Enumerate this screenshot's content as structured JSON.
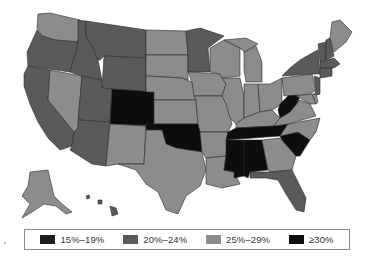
{
  "map": {
    "title": "",
    "region": "United States",
    "colors": {
      "c15_19": "#1c1c1c",
      "c20_24": "#5a5a5a",
      "c25_29": "#8c8c8c",
      "c30plus": "#0d0d0d"
    },
    "states": {
      "WA": "c25_29",
      "OR": "c20_24",
      "CA": "c20_24",
      "ID": "c20_24",
      "NV": "c25_29",
      "MT": "c20_24",
      "WY": "c20_24",
      "UT": "c20_24",
      "AZ": "c20_24",
      "CO": "c30plus",
      "NM": "c25_29",
      "ND": "c25_29",
      "SD": "c25_29",
      "NE": "c25_29",
      "KS": "c25_29",
      "OK": "c30plus",
      "TX": "c25_29",
      "MN": "c20_24",
      "IA": "c25_29",
      "MO": "c25_29",
      "AR": "c25_29",
      "LA": "c25_29",
      "WI": "c25_29",
      "IL": "c25_29",
      "MI": "c25_29",
      "IN": "c25_29",
      "OH": "c25_29",
      "KY": "c25_29",
      "TN": "c30plus",
      "MS": "c30plus",
      "AL": "c30plus",
      "GA": "c25_29",
      "FL": "c20_24",
      "SC": "c30plus",
      "NC": "c25_29",
      "VA": "c25_29",
      "WV": "c30plus",
      "PA": "c25_29",
      "NY": "c20_24",
      "VT": "c20_24",
      "NH": "c20_24",
      "ME": "c25_29",
      "MA": "c20_24",
      "CT": "c20_24",
      "NJ": "c20_24",
      "MD": "c25_29",
      "DE": "c25_29",
      "AK": "c25_29",
      "HI": "c20_24"
    }
  },
  "legend": {
    "items": [
      {
        "label": "15%–19%",
        "color": "#1c1c1c"
      },
      {
        "label": "20%–24%",
        "color": "#5a5a5a"
      },
      {
        "label": "25%–29%",
        "color": "#8c8c8c"
      },
      {
        "label": "≥30%",
        "color": "#0d0d0d"
      }
    ]
  }
}
